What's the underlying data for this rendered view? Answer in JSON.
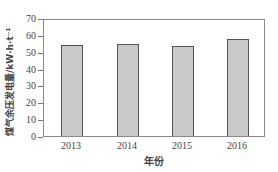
{
  "chart_data": {
    "type": "bar",
    "title": "",
    "xlabel": "年份",
    "ylabel": "煤气余压发电量/kW·h·t⁻¹",
    "categories": [
      "2013",
      "2014",
      "2015",
      "2016"
    ],
    "values": [
      54,
      54.5,
      53.5,
      57.5
    ],
    "ylim": [
      0,
      70
    ],
    "yticks": [
      "0",
      "10",
      "20",
      "30",
      "40",
      "50",
      "60",
      "70"
    ],
    "grid": false,
    "legend": null,
    "bar_color": "#c9c9c9",
    "bar_edge_color": "#555555"
  }
}
